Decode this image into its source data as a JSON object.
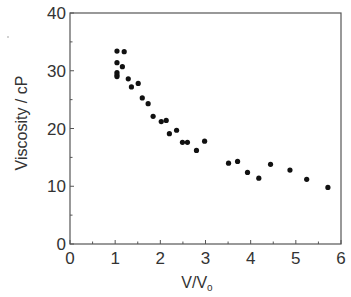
{
  "chart_data": {
    "type": "scatter",
    "title": "",
    "xlabel": "V/V₀",
    "xlabel_main": "V/V",
    "xlabel_sub": "o",
    "ylabel": "Viscosity / cP",
    "xlim": [
      0,
      6
    ],
    "ylim": [
      0,
      40
    ],
    "x_ticks": [
      0,
      1,
      2,
      3,
      4,
      5,
      6
    ],
    "y_ticks": [
      0,
      10,
      20,
      30,
      40
    ],
    "x_minor_step": 0.5,
    "y_minor_step": 5,
    "grid": false,
    "legend": null,
    "marker_color": "#111111",
    "axis_color": "#555555",
    "series": [
      {
        "name": "Viscosity",
        "points": [
          [
            1.04,
            33.4
          ],
          [
            1.2,
            33.3
          ],
          [
            1.04,
            31.4
          ],
          [
            1.16,
            30.7
          ],
          [
            1.04,
            29.7
          ],
          [
            1.04,
            29.3
          ],
          [
            1.04,
            29.0
          ],
          [
            1.29,
            28.6
          ],
          [
            1.36,
            27.2
          ],
          [
            1.51,
            27.8
          ],
          [
            1.6,
            25.3
          ],
          [
            1.73,
            24.3
          ],
          [
            1.84,
            22.1
          ],
          [
            2.02,
            21.2
          ],
          [
            2.13,
            21.4
          ],
          [
            2.2,
            19.1
          ],
          [
            2.36,
            19.7
          ],
          [
            2.49,
            17.6
          ],
          [
            2.6,
            17.6
          ],
          [
            2.8,
            16.2
          ],
          [
            2.98,
            17.8
          ],
          [
            3.51,
            14.0
          ],
          [
            3.71,
            14.3
          ],
          [
            3.93,
            12.4
          ],
          [
            4.18,
            11.4
          ],
          [
            4.44,
            13.8
          ],
          [
            4.87,
            12.8
          ],
          [
            5.24,
            11.2
          ],
          [
            5.71,
            9.8
          ]
        ]
      }
    ]
  }
}
